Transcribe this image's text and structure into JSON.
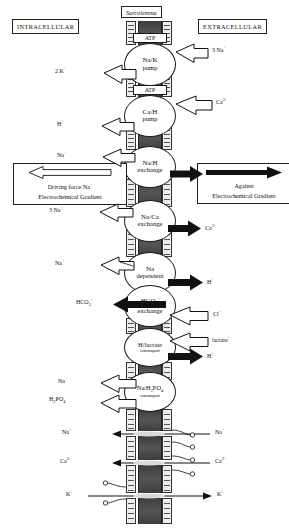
{
  "diagram": {
    "compartments": {
      "intracellular_label": "INTRACELLULAR",
      "extracellular_label": "EXTRACELLULAR",
      "membrane_label": "Sarcolemma"
    },
    "legend": [
      {
        "id": "driving-force",
        "line1": "Driving force Na",
        "line1_sup": "+",
        "line2": "Electrochemical Gradient",
        "arrow_style": "hollow",
        "arrow_direction": "left"
      },
      {
        "id": "against-gradient",
        "line1": "Against",
        "line2": "Electrochemical Gradient",
        "arrow_style": "solid",
        "arrow_direction": "right"
      }
    ],
    "transporters": [
      {
        "id": "na-k-pump",
        "line1": "Na/K",
        "line2": "pump",
        "energy": "ATP",
        "inward_label": "2 K",
        "inward_sup": "+",
        "outward_label": "3 Na",
        "outward_sup": "+"
      },
      {
        "id": "ca-h-pump",
        "line1": "Ca/H",
        "line2": "pump",
        "energy": "ATP",
        "inward_label": "H",
        "inward_sup": "+",
        "outward_label": "Ca",
        "outward_sup": "2+"
      },
      {
        "id": "na-h-exchange",
        "line1": "Na/H",
        "line2": "exchange",
        "energy": "",
        "inward_label": "Na",
        "inward_sup": "+",
        "outward_label": "H",
        "outward_sup": "+"
      },
      {
        "id": "na-ca-exchange",
        "line1": "Na/Ca",
        "line2": "exchange",
        "energy": "",
        "inward_label": "3 Na",
        "inward_sup": "+",
        "outward_label": "Ca",
        "outward_sup": "2+"
      },
      {
        "id": "na-dependent-hco3-exchange",
        "line1": "Na",
        "line2": "dependent",
        "energy": "",
        "inward_label": "Na",
        "inward_sup": "+",
        "outward_label": "H",
        "outward_sup": "+"
      },
      {
        "id": "hco3-exchange",
        "line1": "HCO",
        "line1_sub": "3",
        "line2": "exchange",
        "energy": "",
        "inward_label": "HCO",
        "inward_sub": "3",
        "inward_sup": "-",
        "outward_label": "Cl",
        "outward_sup": "-"
      },
      {
        "id": "h-lactate-cotransport",
        "line1": "H/lactate",
        "line2": "cotransport",
        "energy": "",
        "outward_label_1": "lactate",
        "outward_sup_1": "-",
        "outward_label_2": "H",
        "outward_sup_2": "+"
      },
      {
        "id": "na-h2po4-cotransport",
        "line1": "Na/H",
        "line1_sub": "2",
        "line1_tail": "PO",
        "line1_sub2": "4",
        "line2": "cotransport",
        "energy": "",
        "inward_label_1": "Na",
        "inward_sup_1": "+",
        "inward_label_2": "H",
        "inward_sub_2": "2",
        "inward_tail_2": "PO",
        "inward_sub2_2": "4"
      }
    ],
    "channels": [
      {
        "id": "sodium-channel",
        "inside_label": "Na",
        "inside_sup": "+",
        "outside_label": "Na",
        "outside_sup": "+",
        "flow": "inward"
      },
      {
        "id": "calcium-channel",
        "inside_label": "Ca",
        "inside_sup": "2+",
        "outside_label": "Ca",
        "outside_sup": "2+",
        "flow": "inward"
      },
      {
        "id": "potassium-channel",
        "inside_label": "K",
        "inside_sup": "+",
        "outside_label": "K",
        "outside_sup": "+",
        "flow": "outward"
      }
    ],
    "colors": {
      "membrane_core": "#4a4a4a",
      "membrane_leaflet": "#ededed",
      "outline": "#1a1a1a",
      "background": "#ffffff"
    }
  }
}
